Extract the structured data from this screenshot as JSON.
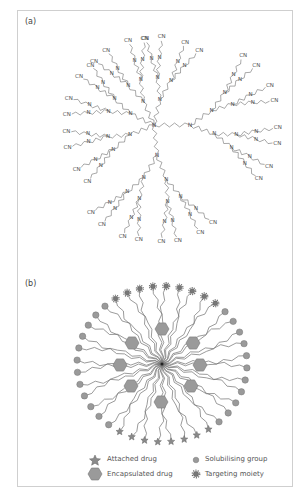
{
  "figure": {
    "panels": [
      {
        "label": "(a)",
        "description": "PAMAM-type dendrimer chemical structure with tertiary amine (N) branch points and nitrile (CN) terminal groups",
        "branch_atom": "N",
        "terminal_group": "CN",
        "core_nodes": 4,
        "generations": 3
      },
      {
        "label": "(b)",
        "description": "Schematic dendrimer drug carrier",
        "center": [
          162,
          364
        ],
        "encapsulated_drug_count": 8
      }
    ],
    "legend": {
      "items": [
        {
          "symbol": "star",
          "label": "Attached drug"
        },
        {
          "symbol": "hexagon",
          "label": "Encapsulated drug"
        },
        {
          "symbol": "circle",
          "label": "Solubilising group"
        },
        {
          "symbol": "gear",
          "label": "Targeting moiety"
        }
      ]
    },
    "colors": {
      "frame": "#cfcfcf",
      "line": "#6e6e6e",
      "shape_fill": "#9a9a9a",
      "shape_stroke": "#707070",
      "text": "#555555"
    }
  }
}
